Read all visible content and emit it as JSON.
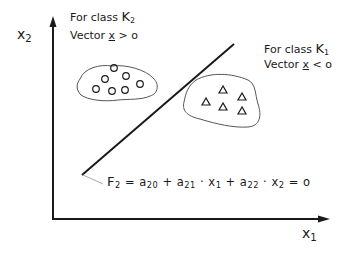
{
  "diagram": {
    "axes": {
      "y_label": {
        "base": "x",
        "sub": "2"
      },
      "x_label": {
        "base": "x",
        "sub": "1"
      }
    },
    "class_k2": {
      "line1": {
        "prefix": "For class ",
        "base": "K",
        "sub": "2"
      },
      "line2": {
        "prefix": "Vector ",
        "vec": "x",
        "suffix": " > o"
      },
      "marker": "circle",
      "count": 7
    },
    "class_k1": {
      "line1": {
        "prefix": "For class ",
        "base": "K",
        "sub": "1"
      },
      "line2": {
        "prefix": "Vector ",
        "vec": "x",
        "suffix": " < o"
      },
      "marker": "triangle",
      "count": 5
    },
    "equation": {
      "F": "F",
      "F_sub": "2",
      "eq1": " = ",
      "a20": "a",
      "a20_sub": "20",
      "plus1": " + ",
      "a21": "a",
      "a21_sub": "21",
      "dot1": " · ",
      "x1": "x",
      "x1_sub": "1",
      "plus2": " + ",
      "a22": "a",
      "a22_sub": "22",
      "dot2": " · ",
      "x2": "x",
      "x2_sub": "2",
      "eq2": " = o"
    },
    "colors": {
      "ink": "#1a1a1a",
      "leader": "#aaaaaa"
    }
  }
}
